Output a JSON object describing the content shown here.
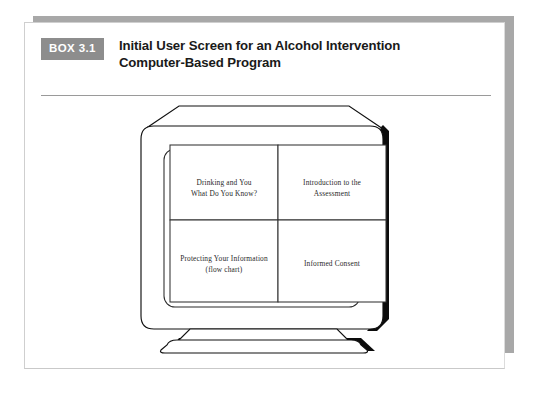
{
  "box": {
    "number_label": "BOX 3.1",
    "title_lines": [
      "Initial User Screen for an Alcohol Intervention",
      "Computer-Based Program"
    ],
    "accent_color": "#8d8d8d",
    "rule_color": "#9a9a9a"
  },
  "figure": {
    "name": "computer-monitor-illustration",
    "screen_panels": [
      {
        "id": "panel-drinking-and-you",
        "lines": [
          "Drinking and You",
          "What Do You Know?"
        ]
      },
      {
        "id": "panel-introduction-to-the-assessment",
        "lines": [
          "Introduction to the",
          "Assessment"
        ]
      },
      {
        "id": "panel-protecting-your-information",
        "lines": [
          "Protecting Your Information",
          "(flow chart)"
        ]
      },
      {
        "id": "panel-informed-consent",
        "lines": [
          "Informed Consent",
          ""
        ]
      }
    ]
  }
}
